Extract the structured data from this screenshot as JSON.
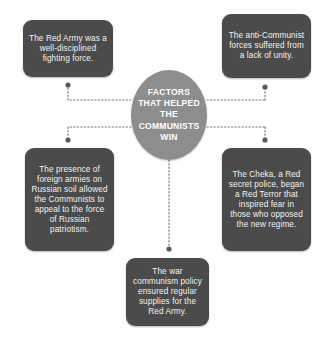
{
  "diagram": {
    "type": "spider-web-concept-map",
    "background_color": "#fefefe",
    "center": {
      "label": "FACTORS THAT HELPED THE COMMUNISTS WIN",
      "lines": [
        "FACTORS",
        "THAT HELPED",
        "THE",
        "COMMUNISTS",
        "WIN"
      ],
      "fill_color": "#8d8d8d",
      "text_color": "#ffffff"
    },
    "node_fill_color": "#4b4b4b",
    "node_text_color": "#f2f2f2",
    "connector_color": "#7a7a7a",
    "nodes": [
      {
        "id": "top-left",
        "text": "The Red Army was a well-disciplined fighting force."
      },
      {
        "id": "top-right",
        "text": "The anti-Communist forces suffered from a lack of unity."
      },
      {
        "id": "left",
        "text": "The presence of foreign armies on Russian soil allowed the Communists to appeal to the force of Russian patriotism."
      },
      {
        "id": "right",
        "text": "The Cheka, a Red secret police, began a Red Terror that inspired fear in those who opposed the new regime."
      },
      {
        "id": "bottom",
        "text": "The war communism policy ensured regular supplies for the Red Army."
      }
    ]
  }
}
